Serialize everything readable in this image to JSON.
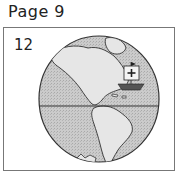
{
  "page": {
    "title": "Page 9"
  },
  "panel": {
    "number": "12",
    "illustration": "globe-americas-with-sailing-ship",
    "colors": {
      "ocean": "#c8c8c8",
      "land": "#e4e4e4",
      "outline": "#333333"
    }
  }
}
